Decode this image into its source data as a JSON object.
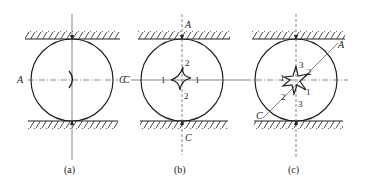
{
  "colors": {
    "ink": "#222222",
    "axis": "#555555",
    "background": "#ffffff"
  },
  "panels": [
    {
      "id": "a",
      "caption": "(a)",
      "center": [
        72,
        80
      ],
      "radius": 41,
      "axis_labels": {
        "left": "A",
        "right": "C"
      },
      "defect_shape": "arc"
    },
    {
      "id": "b",
      "caption": "(b)",
      "center": [
        182,
        80
      ],
      "radius": 41,
      "axis_labels": {
        "left": "C",
        "top": "A",
        "bottom": "C"
      },
      "defect_shape": "four-point-star",
      "point_labels": [
        {
          "text": "2",
          "pos": "top"
        },
        {
          "text": "1",
          "pos": "left"
        },
        {
          "text": "1",
          "pos": "right"
        },
        {
          "text": "2",
          "pos": "bottom"
        }
      ]
    },
    {
      "id": "c",
      "caption": "(c)",
      "center": [
        296,
        80
      ],
      "radius": 41,
      "axis_labels": {
        "diag_top": "A",
        "diag_bottom": "C"
      },
      "defect_shape": "six-point-star",
      "point_labels": [
        {
          "text": "3",
          "pos": "top"
        },
        {
          "text": "2",
          "pos": "upper-right"
        },
        {
          "text": "1",
          "pos": "left"
        },
        {
          "text": "1",
          "pos": "lower-right"
        },
        {
          "text": "2",
          "pos": "lower-left"
        },
        {
          "text": "3",
          "pos": "bottom"
        }
      ]
    }
  ]
}
